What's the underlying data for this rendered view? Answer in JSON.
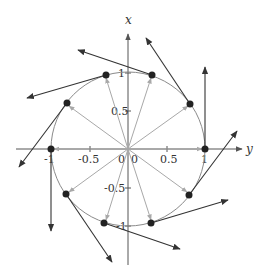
{
  "diagram": {
    "type": "vector_field_on_unit_circle",
    "axes": {
      "horizontal_label": "y",
      "vertical_label": "x",
      "horizontal_ticks": [
        "-1",
        "-0.5",
        "0",
        "0",
        "0.5",
        "1"
      ],
      "vertical_ticks": [
        "1",
        "0.5",
        "-0.5",
        "-1"
      ]
    },
    "colors": {
      "axis": "#555555",
      "circle": "#8a8a8a",
      "radial_arrow": "#a8a8a8",
      "tangent_arrow": "#333333",
      "point": "#222222"
    },
    "points": [
      {
        "angle_deg": 0
      },
      {
        "angle_deg": 36
      },
      {
        "angle_deg": 72
      },
      {
        "angle_deg": 108
      },
      {
        "angle_deg": 144
      },
      {
        "angle_deg": 180
      },
      {
        "angle_deg": 216
      },
      {
        "angle_deg": 252
      },
      {
        "angle_deg": 288
      },
      {
        "angle_deg": 324
      }
    ]
  }
}
